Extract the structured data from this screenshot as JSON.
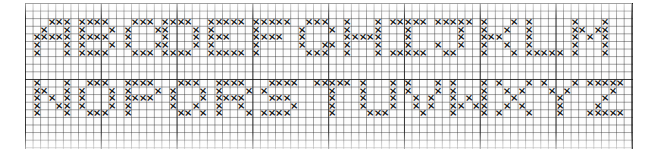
{
  "pattern": {
    "title": "Cross-stitch alphabet chart",
    "stitch_symbol": "×",
    "stitch_color": "#141414",
    "grid_color": "#2a2a2a",
    "background": "#ffffff",
    "grid": {
      "columns": 80,
      "rows": 19,
      "cell_px": 7.58,
      "major_every": 10
    },
    "rows": [
      {
        "name": "row-a-to-m",
        "top_row": 2,
        "letters": [
          {
            "char": "A",
            "col": 1,
            "bitmap": [
              "..XXX",
              ".X..X",
              "XXXXX",
              "X...X",
              "X...X"
            ]
          },
          {
            "char": "B",
            "col": 7,
            "bitmap": [
              "XXXX.",
              "X...X",
              "XXXX.",
              "X...X",
              "XXXX."
            ]
          },
          {
            "char": "C",
            "col": 13,
            "bitmap": [
              ".XXX.",
              "X...X",
              "X....",
              "X...X",
              ".XXX."
            ]
          },
          {
            "char": "D",
            "col": 18,
            "bitmap": [
              "XXXX.",
              "X...X",
              "X...X",
              "X...X",
              "XXXX."
            ]
          },
          {
            "char": "E",
            "col": 24,
            "bitmap": [
              "XXXXX",
              "X....",
              "XXX..",
              "X....",
              "XXXXX"
            ]
          },
          {
            "char": "F",
            "col": 30,
            "bitmap": [
              "XXXXX",
              "X....",
              "XXXX.",
              "X....",
              "X...."
            ]
          },
          {
            "char": "G",
            "col": 36,
            "bitmap": [
              ".XXX.",
              "X...X",
              "X....",
              "X..XX",
              ".XXX."
            ]
          },
          {
            "char": "H",
            "col": 42,
            "bitmap": [
              "X...X",
              "X...X",
              "XXXXX",
              "X...X",
              "X...X"
            ]
          },
          {
            "char": "I",
            "col": 48,
            "bitmap": [
              "XXXXX",
              "..X..",
              "..X..",
              "..X..",
              "XXXXX"
            ]
          },
          {
            "char": "J",
            "col": 54,
            "bitmap": [
              "XXXXX",
              "...X.",
              "...X.",
              "X..X.",
              ".XX.."
            ]
          },
          {
            "char": "K",
            "col": 60,
            "bitmap": [
              "X...X",
              "X..X.",
              "XXX..",
              "X..X.",
              "X...X"
            ]
          },
          {
            "char": "L",
            "col": 66,
            "bitmap": [
              "X....",
              "X....",
              "X....",
              "X....",
              "XXXXX"
            ]
          },
          {
            "char": "M",
            "col": 72,
            "bitmap": [
              "X...X",
              "XX.XX",
              "X.X.X",
              "X...X",
              "X...X"
            ]
          }
        ]
      },
      {
        "name": "row-n-to-z",
        "top_row": 10,
        "letters": [
          {
            "char": "N",
            "col": 1,
            "bitmap": [
              "X...X",
              "XX..X",
              "X.X.X",
              "X..XX",
              "X...X"
            ]
          },
          {
            "char": "O",
            "col": 7,
            "bitmap": [
              ".XXX.",
              "X...X",
              "X...X",
              "X...X",
              ".XXX."
            ]
          },
          {
            "char": "P",
            "col": 13,
            "bitmap": [
              "XXXX.",
              "X...X",
              "XXXX.",
              "X....",
              "X...."
            ]
          },
          {
            "char": "Q",
            "col": 19,
            "bitmap": [
              ".XXX.",
              "X...X",
              "X...X",
              "X..X.",
              ".XX.X"
            ]
          },
          {
            "char": "R",
            "col": 25,
            "bitmap": [
              "XXXX.",
              "X...X",
              "XXXX.",
              "X..X.",
              "X...X"
            ]
          },
          {
            "char": "S",
            "col": 31,
            "bitmap": [
              ".XXXX",
              "X....",
              ".XXX.",
              "....X",
              "XXXX."
            ]
          },
          {
            "char": "T",
            "col": 38,
            "bitmap": [
              "XXXXX",
              "..X..",
              "..X..",
              "..X..",
              "..X.."
            ]
          },
          {
            "char": "U",
            "col": 44,
            "bitmap": [
              "X...X",
              "X...X",
              "X...X",
              "X...X",
              ".XXX."
            ]
          },
          {
            "char": "V",
            "col": 50,
            "bitmap": [
              "X...X",
              "X...X",
              ".X.X.",
              ".X.X.",
              "..X.."
            ]
          },
          {
            "char": "W",
            "col": 56,
            "bitmap": [
              "X...X",
              "X...X",
              "X.X.X",
              "XX.XX",
              "X...X"
            ]
          },
          {
            "char": "X",
            "col": 62,
            "bitmap": [
              "X...X",
              ".X.X.",
              "..X..",
              ".X.X.",
              "X...X"
            ]
          },
          {
            "char": "Y",
            "col": 68,
            "bitmap": [
              "X...X",
              ".X.X.",
              "..X..",
              "..X..",
              "..X.."
            ]
          },
          {
            "char": "Z",
            "col": 74,
            "bitmap": [
              "XXXXX",
              "...X.",
              "..X..",
              ".X...",
              "XXXXX"
            ]
          }
        ]
      }
    ]
  }
}
